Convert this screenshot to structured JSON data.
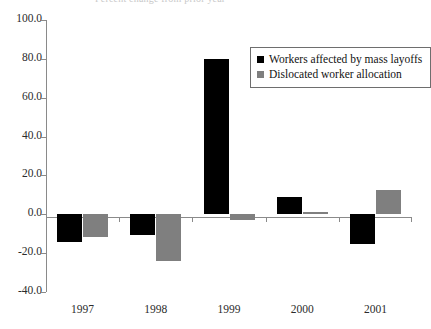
{
  "chart_data": {
    "type": "bar",
    "title": "",
    "xlabel": "",
    "ylabel": "",
    "categories": [
      "1997",
      "1998",
      "1999",
      "2000",
      "2001"
    ],
    "series": [
      {
        "name": "Workers affected by mass layoffs",
        "color": "#000000",
        "values": [
          -14.5,
          -10.5,
          80.0,
          9.0,
          -15.5
        ]
      },
      {
        "name": "Dislocated worker allocation",
        "color": "#7f7f7f",
        "values": [
          -11.5,
          -24.0,
          -3.0,
          1.0,
          12.5
        ]
      }
    ],
    "ylim": [
      -40.0,
      100.0
    ],
    "ytick_labels": [
      "100.0",
      "80.0",
      "60.0",
      "40.0",
      "20.0",
      "0.0",
      "-20.0",
      "-40.0"
    ],
    "ytick_values": [
      100.0,
      80.0,
      60.0,
      40.0,
      20.0,
      0.0,
      -20.0,
      -40.0
    ],
    "grid": false,
    "legend_position": "top-right"
  },
  "title": {
    "text": "Percent change from prior year"
  },
  "legend": {
    "items": [
      {
        "label": "Workers affected by mass layoffs",
        "swatch": "black"
      },
      {
        "label": "Dislocated worker allocation",
        "swatch": "gray"
      }
    ]
  }
}
